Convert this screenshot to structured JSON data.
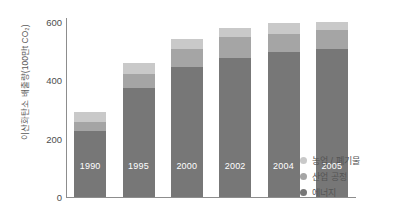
{
  "chart_data": {
    "type": "bar",
    "stacked": true,
    "title": "",
    "xlabel": "",
    "ylabel": "이산화탄소 배출량(100만t CO₂)",
    "categories": [
      "1990",
      "1995",
      "2000",
      "2002",
      "2004",
      "2005"
    ],
    "ylim": [
      0,
      600
    ],
    "yticks": [
      0,
      200,
      400,
      600
    ],
    "grid": false,
    "legend_position": "right-bottom",
    "series": [
      {
        "name": "에너지",
        "color": "#777777",
        "values": [
          225,
          370,
          440,
          472,
          492,
          502
        ]
      },
      {
        "name": "산업 공정",
        "color": "#a5a5a5",
        "values": [
          30,
          48,
          62,
          72,
          62,
          65
        ]
      },
      {
        "name": "농업 / 폐기물",
        "color": "#c9c9c9",
        "values": [
          32,
          38,
          33,
          30,
          35,
          28
        ]
      }
    ],
    "totals": [
      287,
      456,
      535,
      574,
      589,
      595
    ]
  },
  "axis": {
    "y_tick_labels": [
      "600",
      "400",
      "200",
      "0"
    ],
    "y_title": "이산화탄소 배출량(100만t CO₂)"
  },
  "bar_labels": [
    "1990",
    "1995",
    "2000",
    "2002",
    "2004",
    "2005"
  ],
  "legend": {
    "items": [
      {
        "label": "농업 / 폐기물",
        "color": "#c9c9c9"
      },
      {
        "label": "산업 공정",
        "color": "#a5a5a5"
      },
      {
        "label": "에너지",
        "color": "#777777"
      }
    ]
  },
  "colors": {
    "energy": "#777777",
    "industry": "#a5a5a5",
    "agriculture": "#c9c9c9",
    "axis": "#8d8d8d",
    "text": "#4d4d4d",
    "background": "#ffffff"
  }
}
